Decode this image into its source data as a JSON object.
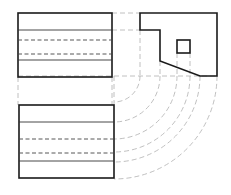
{
  "drawing": {
    "type": "orthographic-projection",
    "colors": {
      "outline": "#1a1a1a",
      "hidden_line": "#444444",
      "projection_line": "#b0b0b0",
      "background": "#ffffff"
    },
    "views": {
      "front": {
        "rect": [
          18,
          13,
          94,
          64
        ],
        "solid_lines_y": [
          30,
          60
        ],
        "hidden_lines_y": [
          40,
          54
        ]
      },
      "side": {
        "outline_points": [
          [
            140,
            13
          ],
          [
            217,
            13
          ],
          [
            217,
            76
          ],
          [
            200,
            76
          ],
          [
            160,
            61
          ],
          [
            160,
            30
          ],
          [
            140,
            30
          ]
        ],
        "square": [
          177,
          40,
          13,
          13
        ]
      },
      "top": {
        "rect": [
          19,
          105,
          95,
          73
        ],
        "solid_lines_y": [
          122,
          161
        ],
        "hidden_lines_y": [
          139,
          153
        ]
      }
    },
    "projection": {
      "arc_center": [
        114,
        76
      ],
      "radii": [
        26,
        46,
        63,
        76,
        86,
        103
      ]
    }
  }
}
